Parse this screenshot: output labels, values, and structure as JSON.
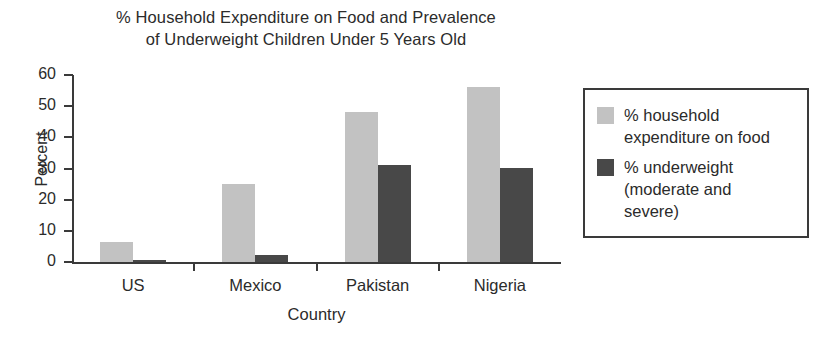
{
  "chart_data": {
    "type": "bar",
    "title": "% Household Expenditure on Food and Prevalence of Underweight Children Under 5 Years Old",
    "title_lines": [
      "% Household Expenditure on Food and Prevalence",
      "of Underweight Children Under 5 Years Old"
    ],
    "xlabel": "Country",
    "ylabel": "Percent",
    "categories": [
      "US",
      "Mexico",
      "Pakistan",
      "Nigeria"
    ],
    "ylim": [
      0,
      60
    ],
    "yticks": [
      0,
      10,
      20,
      30,
      40,
      50,
      60
    ],
    "ytick_labels": [
      "0",
      "10",
      "20",
      "30",
      "40",
      "50",
      "60"
    ],
    "grid": false,
    "legend_position": "right",
    "series": [
      {
        "name": "% household expenditure on food",
        "name_lines": [
          "% household",
          "expenditure on food"
        ],
        "color": "#c2c2c2",
        "values": [
          6.4,
          25,
          48,
          56
        ]
      },
      {
        "name": "% underweight (moderate and severe)",
        "name_lines": [
          "% underweight",
          "(moderate and",
          "severe)"
        ],
        "color": "#484848",
        "values": [
          0.5,
          2.3,
          31,
          30.3
        ]
      }
    ]
  },
  "colors": {
    "series_light": "#c2c2c2",
    "series_dark": "#484848",
    "axis": "#3a3a3a",
    "text": "#2b2b2b",
    "background": "#ffffff"
  }
}
